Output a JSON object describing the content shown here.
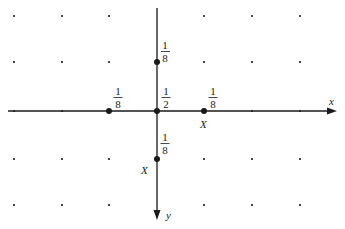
{
  "diagram": {
    "type": "lattice random walk transition diagram",
    "axes": {
      "x_label": "x",
      "y_label": "y",
      "x_direction": "right",
      "y_direction": "down"
    },
    "grid": {
      "columns_px": [
        14,
        62,
        109,
        157,
        204,
        252,
        300
      ],
      "rows_px": [
        16,
        62,
        111,
        159,
        205
      ],
      "origin_px": [
        157,
        111
      ]
    },
    "nodes": [
      {
        "id": "origin",
        "label_num": "1",
        "label_den": "2",
        "prob": "1/2",
        "x": 157,
        "y": 111
      },
      {
        "id": "up",
        "label_num": "1",
        "label_den": "8",
        "prob": "1/8",
        "x": 157,
        "y": 62
      },
      {
        "id": "left",
        "label_num": "1",
        "label_den": "8",
        "prob": "1/8",
        "x": 109,
        "y": 111
      },
      {
        "id": "right",
        "label_num": "1",
        "label_den": "8",
        "prob": "1/8",
        "x": 204,
        "y": 111,
        "marker": "X"
      },
      {
        "id": "down",
        "label_num": "1",
        "label_den": "8",
        "prob": "1/8",
        "x": 157,
        "y": 159,
        "marker": "X"
      }
    ],
    "markers": {
      "right_marker": "X",
      "down_marker": "X"
    },
    "colors": {
      "ink": "#1a1a1a",
      "background": "#ffffff"
    }
  }
}
